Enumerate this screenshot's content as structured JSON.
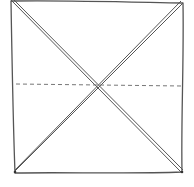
{
  "diagram": {
    "colors": {
      "stroke": "#555555",
      "dashed": "#777777",
      "background": "#ffffff"
    },
    "square": {
      "corners": {
        "top_left": [
          11,
          1
        ],
        "top_right": [
          183,
          3
        ],
        "bottom_right": [
          182,
          172
        ],
        "bottom_left": [
          15,
          173
        ]
      }
    },
    "center": [
      98,
      86
    ],
    "fold_lines": [
      {
        "type": "valley-double",
        "from": "top_left",
        "to": "bottom_right"
      },
      {
        "type": "valley-double",
        "from": "top_right",
        "to": "bottom_left"
      }
    ],
    "dashed_line": {
      "x1": 16,
      "y1": 84,
      "x2": 182,
      "y2": 86
    }
  }
}
